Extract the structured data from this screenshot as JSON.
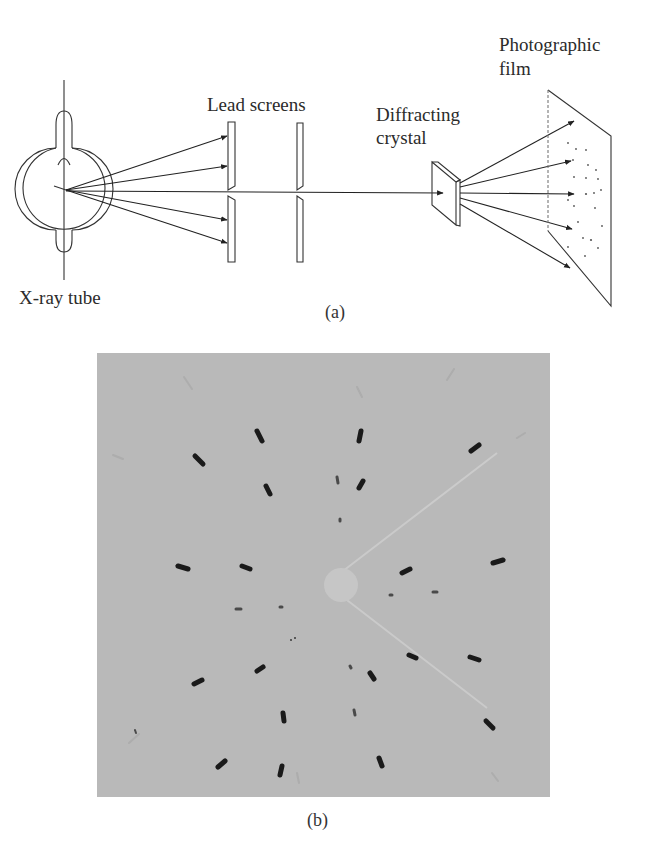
{
  "figure_a": {
    "caption": "(a)",
    "labels": {
      "xray_tube": "X-ray tube",
      "lead_screens": "Lead screens",
      "diffracting_crystal_line1": "Diffracting",
      "diffracting_crystal_line2": "crystal",
      "photographic_film_line1": "Photographic",
      "photographic_film_line2": "film"
    }
  },
  "figure_b": {
    "caption": "(b)",
    "description": "Laue diffraction photograph showing symmetric pattern of dark spots around a central beam stop",
    "background_color": "#b9b9b9",
    "spot_color": "#1a1a1a"
  }
}
